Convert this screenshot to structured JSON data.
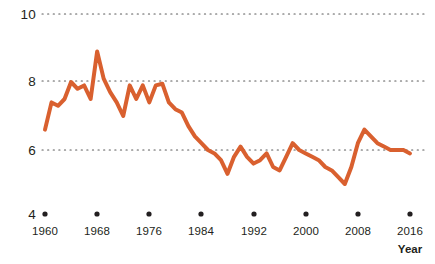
{
  "chart_data": {
    "type": "line",
    "title": "",
    "subtitle": "",
    "xlabel": "Year",
    "ylabel": "",
    "xlim": [
      1960,
      2016
    ],
    "ylim": [
      4,
      10
    ],
    "grid": "horizontal-dotted",
    "legend": "none",
    "line_color": "#d9602f",
    "line_width_px": 4,
    "y_ticks": [
      {
        "value": 10,
        "label": "10"
      },
      {
        "value": 8,
        "label": "8"
      },
      {
        "value": 6,
        "label": "6"
      },
      {
        "value": 4,
        "label": "4"
      }
    ],
    "x_ticks": [
      {
        "value": 1960,
        "label": "1960"
      },
      {
        "value": 1968,
        "label": "1968"
      },
      {
        "value": 1976,
        "label": "1976"
      },
      {
        "value": 1984,
        "label": "1984"
      },
      {
        "value": 1992,
        "label": "1992"
      },
      {
        "value": 2000,
        "label": "2000"
      },
      {
        "value": 2008,
        "label": "2008"
      },
      {
        "value": 2016,
        "label": "2016"
      }
    ],
    "x": [
      1960,
      1961,
      1962,
      1963,
      1964,
      1965,
      1966,
      1967,
      1968,
      1969,
      1970,
      1971,
      1972,
      1973,
      1974,
      1975,
      1976,
      1977,
      1978,
      1979,
      1980,
      1981,
      1982,
      1983,
      1984,
      1985,
      1986,
      1987,
      1988,
      1989,
      1990,
      1991,
      1992,
      1993,
      1994,
      1995,
      1996,
      1997,
      1998,
      1999,
      2000,
      2001,
      2002,
      2003,
      2004,
      2005,
      2006,
      2007,
      2008,
      2009,
      2010,
      2011,
      2012,
      2013,
      2014,
      2015,
      2016
    ],
    "values": [
      6.6,
      7.4,
      7.3,
      7.5,
      8.0,
      7.8,
      7.9,
      7.5,
      8.9,
      8.1,
      7.7,
      7.4,
      7.0,
      7.9,
      7.5,
      7.9,
      7.4,
      7.9,
      7.95,
      7.4,
      7.2,
      7.1,
      6.7,
      6.4,
      6.2,
      6.0,
      5.9,
      5.7,
      5.3,
      5.8,
      6.1,
      5.8,
      5.6,
      5.7,
      5.9,
      5.5,
      5.4,
      5.8,
      6.2,
      6.0,
      5.9,
      5.8,
      5.7,
      5.5,
      5.4,
      5.2,
      5.0,
      5.5,
      6.2,
      6.6,
      6.4,
      6.2,
      6.1,
      6.0,
      6.0,
      6.0,
      5.9
    ],
    "data_note": "single series, values estimated from pixel trace against 4-10 axis"
  },
  "axes": {
    "x_axis_title": "Year"
  }
}
